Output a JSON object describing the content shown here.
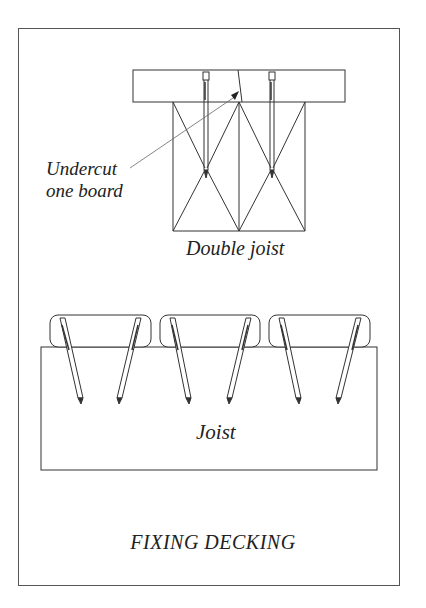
{
  "figure": {
    "title": "FIXING DECKING",
    "labels": {
      "undercut_line1": "Undercut",
      "undercut_line2": "one board",
      "double_joist": "Double joist",
      "joist": "Joist"
    }
  },
  "colors": {
    "line": "#333333",
    "frame": "#555555",
    "background": "#ffffff"
  }
}
